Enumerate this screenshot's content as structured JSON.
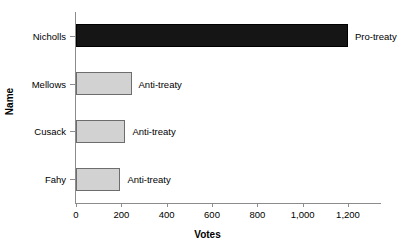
{
  "chart_data": {
    "type": "bar",
    "orientation": "horizontal",
    "title": "",
    "xlabel": "Votes",
    "ylabel": "Name",
    "categories": [
      "Nicholls",
      "Mellows",
      "Cusack",
      "Fahy"
    ],
    "values": [
      1200,
      245,
      218,
      196
    ],
    "series": [
      {
        "name": "Votes",
        "values": [
          1200,
          245,
          218,
          196
        ]
      }
    ],
    "annotations": [
      "Pro-treaty",
      "Anti-treaty",
      "Anti-treaty",
      "Anti-treaty"
    ],
    "bar_colors": [
      "#151515",
      "#d2d2d2",
      "#d2d2d2",
      "#d2d2d2"
    ],
    "xlim": [
      0,
      1350
    ],
    "xticks": [
      0,
      200,
      400,
      600,
      800,
      1000,
      1200
    ],
    "xtick_labels": [
      "0",
      "200",
      "400",
      "600",
      "800",
      "1,000",
      "1,200"
    ],
    "grid": false,
    "legend": false,
    "bars": [
      {
        "category": "Nicholls",
        "value": 1200,
        "annotation": "Pro-treaty",
        "color": "#151515"
      },
      {
        "category": "Mellows",
        "value": 245,
        "annotation": "Anti-treaty",
        "color": "#d2d2d2"
      },
      {
        "category": "Cusack",
        "value": 218,
        "annotation": "Anti-treaty",
        "color": "#d2d2d2"
      },
      {
        "category": "Fahy",
        "value": 196,
        "annotation": "Anti-treaty",
        "color": "#d2d2d2"
      }
    ]
  }
}
